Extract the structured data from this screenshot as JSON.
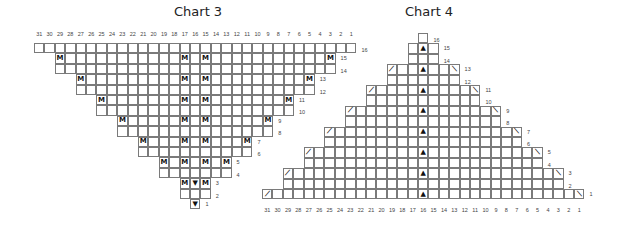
{
  "charts": [
    {
      "title": "Chart 3",
      "columns": [
        31,
        30,
        29,
        28,
        27,
        26,
        25,
        24,
        23,
        22,
        21,
        20,
        19,
        18,
        17,
        16,
        15,
        14,
        13,
        12,
        11,
        10,
        9,
        8,
        7,
        6,
        5,
        4,
        3,
        2,
        1
      ],
      "rows": [
        {
          "row": 16,
          "from": 31,
          "to": 1,
          "symbols": {}
        },
        {
          "row": 15,
          "from": 29,
          "to": 3,
          "symbols": {
            "29": "M",
            "17": "M",
            "15": "M",
            "3": "M"
          }
        },
        {
          "row": 14,
          "from": 29,
          "to": 3,
          "symbols": {}
        },
        {
          "row": 13,
          "from": 27,
          "to": 5,
          "symbols": {
            "27": "M",
            "17": "M",
            "15": "M",
            "5": "M"
          }
        },
        {
          "row": 12,
          "from": 27,
          "to": 5,
          "symbols": {}
        },
        {
          "row": 11,
          "from": 25,
          "to": 7,
          "symbols": {
            "25": "M",
            "17": "M",
            "15": "M",
            "7": "M"
          }
        },
        {
          "row": 10,
          "from": 25,
          "to": 7,
          "symbols": {}
        },
        {
          "row": 9,
          "from": 23,
          "to": 9,
          "symbols": {
            "23": "M",
            "17": "M",
            "15": "M",
            "9": "M"
          }
        },
        {
          "row": 8,
          "from": 23,
          "to": 9,
          "symbols": {}
        },
        {
          "row": 7,
          "from": 21,
          "to": 11,
          "symbols": {
            "21": "M",
            "17": "M",
            "15": "M",
            "11": "M"
          }
        },
        {
          "row": 6,
          "from": 21,
          "to": 11,
          "symbols": {}
        },
        {
          "row": 5,
          "from": 19,
          "to": 13,
          "symbols": {
            "19": "M",
            "17": "M",
            "15": "M",
            "13": "M"
          }
        },
        {
          "row": 4,
          "from": 19,
          "to": 13,
          "symbols": {}
        },
        {
          "row": 3,
          "from": 17,
          "to": 15,
          "symbols": {
            "17": "M",
            "16": "▼",
            "15": "M"
          }
        },
        {
          "row": 2,
          "from": 17,
          "to": 15,
          "symbols": {}
        },
        {
          "row": 1,
          "from": 16,
          "to": 16,
          "symbols": {
            "16": "▼"
          }
        }
      ],
      "col_labels_position": "top"
    },
    {
      "title": "Chart 4",
      "columns": [
        31,
        30,
        29,
        28,
        27,
        26,
        25,
        24,
        23,
        22,
        21,
        20,
        19,
        18,
        17,
        16,
        15,
        14,
        13,
        12,
        11,
        10,
        9,
        8,
        7,
        6,
        5,
        4,
        3,
        2,
        1
      ],
      "rows": [
        {
          "row": 16,
          "from": 16,
          "to": 16,
          "symbols": {}
        },
        {
          "row": 15,
          "from": 17,
          "to": 15,
          "symbols": {
            "16": "▲"
          }
        },
        {
          "row": 14,
          "from": 17,
          "to": 15,
          "symbols": {}
        },
        {
          "row": 13,
          "from": 19,
          "to": 13,
          "symbols": {
            "19": "⟋",
            "16": "▲",
            "13": "⟍"
          }
        },
        {
          "row": 12,
          "from": 19,
          "to": 13,
          "symbols": {}
        },
        {
          "row": 11,
          "from": 21,
          "to": 11,
          "symbols": {
            "21": "⟋",
            "16": "▲",
            "11": "⟍"
          }
        },
        {
          "row": 10,
          "from": 21,
          "to": 11,
          "symbols": {}
        },
        {
          "row": 9,
          "from": 23,
          "to": 9,
          "symbols": {
            "23": "⟋",
            "16": "▲",
            "9": "⟍"
          }
        },
        {
          "row": 8,
          "from": 23,
          "to": 9,
          "symbols": {}
        },
        {
          "row": 7,
          "from": 25,
          "to": 7,
          "symbols": {
            "25": "⟋",
            "16": "▲",
            "7": "⟍"
          }
        },
        {
          "row": 6,
          "from": 25,
          "to": 7,
          "symbols": {}
        },
        {
          "row": 5,
          "from": 27,
          "to": 5,
          "symbols": {
            "27": "⟋",
            "16": "▲",
            "5": "⟍"
          }
        },
        {
          "row": 4,
          "from": 27,
          "to": 5,
          "symbols": {}
        },
        {
          "row": 3,
          "from": 29,
          "to": 3,
          "symbols": {
            "29": "⟋",
            "16": "▲",
            "3": "⟍"
          }
        },
        {
          "row": 2,
          "from": 29,
          "to": 3,
          "symbols": {}
        },
        {
          "row": 1,
          "from": 31,
          "to": 1,
          "symbols": {
            "31": "⟋",
            "16": "▲",
            "1": "⟍"
          }
        }
      ],
      "col_labels_position": "bottom"
    }
  ],
  "symbols_legend": {
    "M": "make-one",
    "▼": "double-decrease-down",
    "▲": "central-double-decrease",
    "⟋": "left-decrease",
    "⟍": "right-decrease"
  }
}
